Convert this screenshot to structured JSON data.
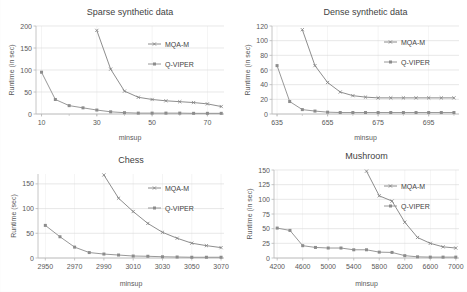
{
  "figure": {
    "panel_count": 4,
    "legend_series": [
      "MQA-M",
      "Q-VIPER"
    ],
    "series_color_mqam": "#808080",
    "series_color_qviper": "#8c8c8c",
    "grid_color": "#d9d9d9",
    "axis_color": "#b7b7b7",
    "background": "#ffffff"
  },
  "chart_data": [
    {
      "type": "line",
      "title": "Sparse synthetic data",
      "xlabel": "minsup",
      "ylabel": "Runtime (in sec)",
      "xlim": [
        8,
        76
      ],
      "ylim": [
        0,
        200
      ],
      "xticks": [
        10,
        30,
        50,
        70
      ],
      "yticks": [
        0,
        50,
        100,
        150,
        200
      ],
      "grid": true,
      "legend_position": "upper-right-inside",
      "x": [
        10,
        15,
        20,
        25,
        30,
        35,
        40,
        45,
        50,
        55,
        60,
        65,
        70,
        75
      ],
      "series": [
        {
          "name": "MQA-M",
          "values": [
            null,
            null,
            null,
            null,
            190,
            102,
            52,
            38,
            33,
            30,
            28,
            26,
            23,
            17
          ]
        },
        {
          "name": "Q-VIPER",
          "values": [
            95,
            33,
            19,
            14,
            9,
            5,
            3,
            2,
            2,
            2,
            2,
            1.5,
            1.5,
            1.5
          ]
        }
      ]
    },
    {
      "type": "line",
      "title": "Dense synthetic data",
      "xlabel": "minsup",
      "ylabel": "Runtime (in sec)",
      "xlim": [
        633,
        707
      ],
      "ylim": [
        0,
        120
      ],
      "xticks": [
        635,
        655,
        675,
        695
      ],
      "yticks": [
        0,
        20,
        40,
        60,
        80,
        100,
        120
      ],
      "grid": true,
      "legend_position": "upper-right-inside",
      "x": [
        635,
        640,
        645,
        650,
        655,
        660,
        665,
        670,
        675,
        680,
        685,
        690,
        695,
        700,
        705
      ],
      "series": [
        {
          "name": "MQA-M",
          "values": [
            null,
            null,
            115,
            66,
            43,
            30,
            25,
            23,
            22,
            22,
            22,
            22,
            22,
            22,
            22
          ]
        },
        {
          "name": "Q-VIPER",
          "values": [
            66,
            17,
            6,
            4,
            2.5,
            2,
            2,
            2,
            2,
            2,
            2,
            2,
            2,
            2,
            2
          ]
        }
      ]
    },
    {
      "type": "line",
      "title": "Chess",
      "xlabel": "minsup",
      "ylabel": "Runtime (sec)",
      "xlim": [
        2945,
        3072
      ],
      "ylim": [
        0,
        170
      ],
      "xticks": [
        2950,
        2970,
        2990,
        3010,
        3030,
        3050,
        3070
      ],
      "yticks": [
        0,
        50,
        100,
        150
      ],
      "grid": true,
      "legend_position": "upper-right-inside",
      "x": [
        2950,
        2960,
        2970,
        2980,
        2990,
        3000,
        3010,
        3020,
        3030,
        3040,
        3050,
        3060,
        3070
      ],
      "series": [
        {
          "name": "MQA-M",
          "values": [
            null,
            null,
            null,
            null,
            168,
            121,
            94,
            70,
            52,
            40,
            30,
            25,
            21
          ]
        },
        {
          "name": "Q-VIPER",
          "values": [
            66,
            43,
            22,
            11,
            8,
            6,
            4,
            3.5,
            2.5,
            2,
            1.5,
            1.5,
            1.5
          ]
        }
      ]
    },
    {
      "type": "line",
      "title": "Mushroom",
      "xlabel": "minsup",
      "ylabel": "Runtime (in sec)",
      "xlim": [
        4150,
        7050
      ],
      "ylim": [
        0,
        150
      ],
      "xticks": [
        4200,
        4600,
        5000,
        5400,
        5800,
        6200,
        6600,
        7000
      ],
      "yticks": [
        0,
        25,
        50,
        75,
        100,
        125,
        150
      ],
      "grid": true,
      "legend_position": "upper-right-inside",
      "x": [
        4200,
        4400,
        4600,
        4800,
        5000,
        5200,
        5400,
        5600,
        5800,
        6000,
        6200,
        6400,
        6600,
        6800,
        7000
      ],
      "series": [
        {
          "name": "MQA-M",
          "values": [
            null,
            null,
            null,
            null,
            null,
            null,
            null,
            148,
            106,
            97,
            61,
            35,
            25,
            19,
            17
          ]
        },
        {
          "name": "Q-VIPER",
          "values": [
            51,
            47,
            21,
            18,
            17,
            17,
            14,
            14,
            10,
            9.5,
            4,
            2,
            1.5,
            1.5,
            1.5
          ]
        }
      ]
    }
  ]
}
